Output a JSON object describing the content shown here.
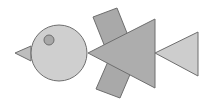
{
  "figure": {
    "width": 208,
    "height": 108,
    "background": "#ffffff",
    "stroke": "#6e6e6e",
    "shapes": {
      "beak": {
        "type": "triangle",
        "fill": "#bdbdbd"
      },
      "body": {
        "type": "circle",
        "fill": "#cfcfcf"
      },
      "eye": {
        "type": "circle",
        "fill": "#a8a8a8"
      },
      "wing_top": {
        "type": "rectangle",
        "fill": "#a9a9a9"
      },
      "wing_bottom": {
        "type": "rectangle",
        "fill": "#a9a9a9"
      },
      "tail_main": {
        "type": "triangle",
        "fill": "#adadad"
      },
      "tail_end": {
        "type": "triangle",
        "fill": "#cdcdcd"
      }
    }
  }
}
